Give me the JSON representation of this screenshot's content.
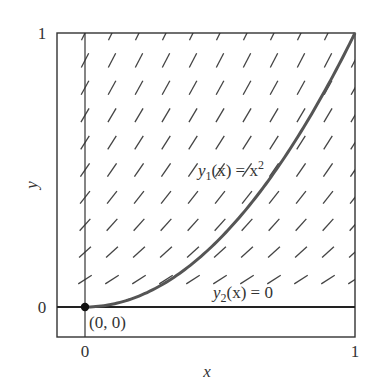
{
  "figure": {
    "type": "direction_field",
    "ode": "dy/dx = 2*sqrt(y)",
    "frame": {
      "left": 57,
      "top": 33,
      "right": 355,
      "bottom": 337
    },
    "origin_px": {
      "x": 85,
      "y": 307
    },
    "scale_px": {
      "x": 270,
      "y": 274
    },
    "x_range": [
      0,
      1
    ],
    "y_range": [
      0,
      1
    ],
    "grid_step": 0.1,
    "segment_length_px": 16,
    "colors": {
      "frame": "#333333",
      "segment": "#444444",
      "curve": "#555555",
      "zero_solution": "#222222",
      "dot": "#111111",
      "text": "#333333"
    }
  },
  "axes": {
    "x_label": "x",
    "y_label": "y",
    "x_ticks": [
      {
        "value": 0,
        "label": "0"
      },
      {
        "value": 1,
        "label": "1"
      }
    ],
    "y_ticks": [
      {
        "value": 0,
        "label": "0"
      },
      {
        "value": 1,
        "label": "1"
      }
    ]
  },
  "curves": [
    {
      "name": "y1",
      "expression": "x^2",
      "label_base": "y",
      "label_sub": "1",
      "label_mid": "(x) = x",
      "label_sup": "2"
    },
    {
      "name": "y2",
      "expression": "0",
      "label_base": "y",
      "label_sub": "2",
      "label_mid": "(x) = 0"
    }
  ],
  "point": {
    "x": 0,
    "y": 0,
    "label": "(0, 0)"
  }
}
